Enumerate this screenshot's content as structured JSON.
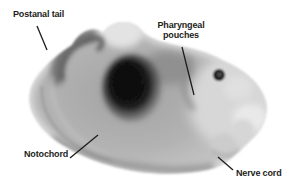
{
  "figure": {
    "background_color": "#ffffff",
    "label_text_color": "#1d1d1b",
    "leader_line_color": "#1d1d1b",
    "labels": [
      {
        "id": "postanal-tail",
        "text": "Postanal tail"
      },
      {
        "id": "pharyngeal-pouches",
        "text": "Pharyngeal pouches"
      },
      {
        "id": "notochord",
        "text": "Notochord"
      },
      {
        "id": "nerve-cord",
        "text": "Nerve cord"
      }
    ]
  }
}
